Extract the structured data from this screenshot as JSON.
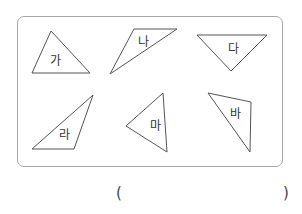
{
  "figure": {
    "stroke_color": "#555555",
    "panel_border_color": "#a8a8a8",
    "triangles": [
      {
        "label": "가",
        "points": "51,31 32,73 90,73",
        "label_x": 55,
        "label_y": 61
      },
      {
        "label": "나",
        "points": "134,29 177,29 110,74",
        "label_x": 143,
        "label_y": 42
      },
      {
        "label": "다",
        "points": "197,35 267,35 231,71",
        "label_x": 233,
        "label_y": 49
      },
      {
        "label": "라",
        "points": "93,95 32,149 74,149",
        "label_x": 64,
        "label_y": 135
      },
      {
        "label": "마",
        "points": "126,126 163,93 167,152",
        "label_x": 155,
        "label_y": 126
      },
      {
        "label": "바",
        "points": "208,93 251,102 250,152",
        "label_x": 235,
        "label_y": 114
      }
    ]
  },
  "answer": {
    "open_paren": "(",
    "close_paren": ")",
    "value": ""
  }
}
